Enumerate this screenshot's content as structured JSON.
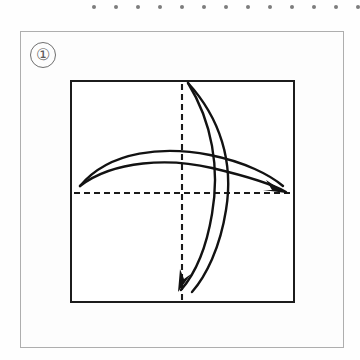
{
  "page": {
    "background_color": "#fefefe",
    "width": 360,
    "height": 360
  },
  "perforation_strip": {
    "name": "dotted-edge-strip",
    "dot_color": "#7d7d7d",
    "dot_count": 13,
    "dot_diameter_px": 4,
    "first_dot_x": 92,
    "spacing_px": 22,
    "y": 5
  },
  "figure_card": {
    "border_color": "#aeaeae",
    "fill_color": "#fdfdfd",
    "x": 20,
    "y": 31,
    "width": 324,
    "height": 317
  },
  "step_label": {
    "text": "①",
    "plain_text": "1",
    "color": "#5d5d5d",
    "shape": "circled-numeral"
  },
  "diagram": {
    "type": "instructional-fold-diagram",
    "square": {
      "stroke_color": "#1c1c1c",
      "stroke_width": 2,
      "x": 70,
      "y": 80,
      "width": 225,
      "height": 223
    },
    "axes": {
      "style": "dashed",
      "stroke_color": "#1a1a1a",
      "dash_pattern": "6,4",
      "vertical": {
        "x": 112,
        "y1": 4,
        "y2": 220
      },
      "horizontal": {
        "y": 113,
        "x1": 4,
        "x2": 221
      }
    },
    "arrows": [
      {
        "name": "horizontal-fold-arrow",
        "direction": "left-to-right",
        "style": "double-line-curved-arrow",
        "start": [
          10,
          106
        ],
        "end": [
          213,
          108
        ],
        "arrowhead": "filled-thin-triangle",
        "arrowhead_at": [
          211,
          107
        ]
      },
      {
        "name": "vertical-fold-arrow",
        "direction": "top-to-bottom",
        "style": "double-line-curved-arrow",
        "start": [
          118,
          3
        ],
        "end": [
          113,
          210
        ],
        "arrowhead": "filled-thin-triangle",
        "arrowhead_at": [
          112,
          209
        ]
      }
    ],
    "stroke_color": "#121212"
  }
}
